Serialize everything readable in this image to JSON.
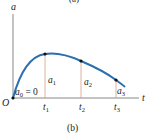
{
  "top_caption": "(a)",
  "caption": "(b)",
  "axes": {
    "y_label": "a",
    "x_label": "t",
    "origin_label": "O"
  },
  "annotations": {
    "a0": "a",
    "a0_sub": "0",
    "a0_eq": " = 0",
    "a1": "a",
    "a1_sub": "1",
    "a2": "a",
    "a2_sub": "2",
    "a3": "a",
    "a3_sub": "3",
    "t1": "t",
    "t1_sub": "1",
    "t2": "t",
    "t2_sub": "2",
    "t3": "t",
    "t3_sub": "3"
  },
  "colors": {
    "curve": "#2a6fb0",
    "axis": "#888888",
    "drop_lines": "#d9a088",
    "points": "#111111"
  }
}
